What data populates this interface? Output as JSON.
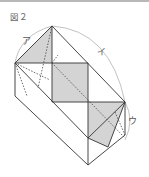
{
  "figure": {
    "title": "図２",
    "labels": {
      "a": "ア",
      "i": "イ",
      "u": "ウ"
    },
    "colors": {
      "line": "#333333",
      "shade": "#d4d4d4",
      "arc": "#888888"
    }
  }
}
